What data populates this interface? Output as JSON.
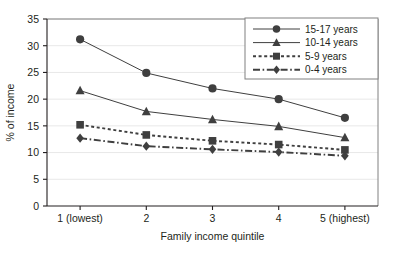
{
  "chart_data": {
    "type": "line",
    "title": "",
    "xlabel": "Family income quintile",
    "ylabel": "% of income",
    "categories": [
      "1 (lowest)",
      "2",
      "3",
      "4",
      "5 (highest)"
    ],
    "x": [
      1,
      2,
      3,
      4,
      5
    ],
    "ylim": [
      0,
      35
    ],
    "yticks": [
      0,
      5,
      10,
      15,
      20,
      25,
      30,
      35
    ],
    "ytick_labels": [
      "0",
      "5",
      "10",
      "15",
      "20",
      "25",
      "30",
      "35"
    ],
    "grid": true,
    "legend_position": "top-right",
    "series": [
      {
        "name": "15-17 years",
        "marker": "circle",
        "linestyle": "solid",
        "color": "#3f3f3f",
        "values": [
          31.2,
          24.9,
          22.0,
          20.0,
          16.5
        ]
      },
      {
        "name": "10-14 years",
        "marker": "triangle",
        "linestyle": "solid",
        "color": "#3f3f3f",
        "values": [
          21.6,
          17.7,
          16.2,
          14.9,
          12.8
        ]
      },
      {
        "name": "5-9 years",
        "marker": "square",
        "linestyle": "dotted",
        "color": "#3f3f3f",
        "values": [
          15.2,
          13.3,
          12.2,
          11.5,
          10.5
        ]
      },
      {
        "name": "0-4 years",
        "marker": "diamond",
        "linestyle": "dashdot",
        "color": "#3f3f3f",
        "values": [
          12.7,
          11.2,
          10.6,
          10.1,
          9.4
        ]
      }
    ]
  },
  "axis": {
    "y_label": "% of income",
    "x_label": "Family income quintile"
  },
  "legend": {
    "items": [
      {
        "label": "15-17 years"
      },
      {
        "label": "10-14 years"
      },
      {
        "label": "5-9 years"
      },
      {
        "label": "0-4 years"
      }
    ]
  },
  "colors": {
    "ink": "#231f20",
    "series": "#3f3f3f",
    "grid": "#e8e8e8",
    "frame": "#808080",
    "background": "#ffffff"
  }
}
